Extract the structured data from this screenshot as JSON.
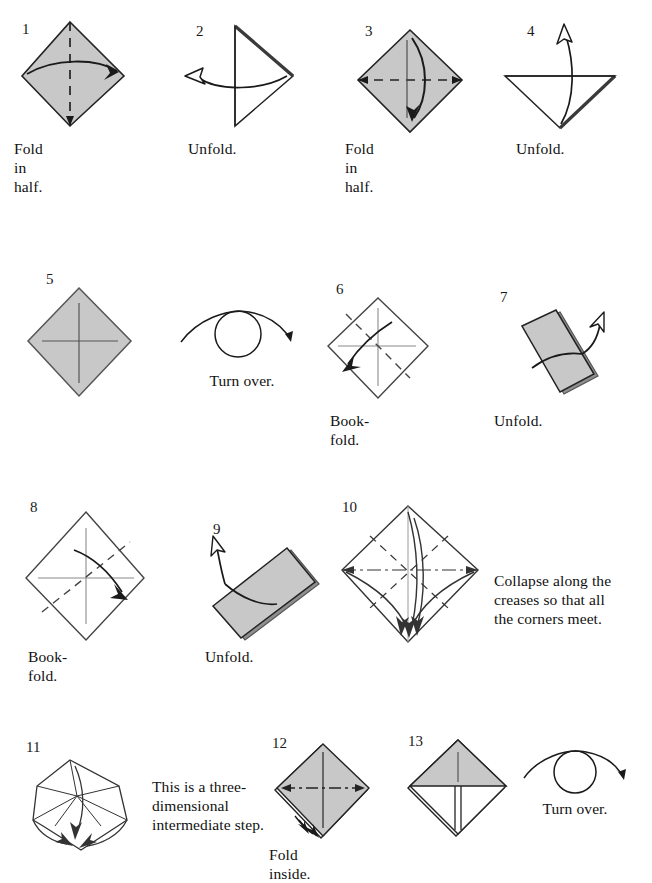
{
  "document": {
    "title": "Origami folding instructions",
    "page_background": "#ffffff",
    "ink_color": "#1a1a1a",
    "paper_gray": "#c8c8c8",
    "paper_gray_edge": "#9a9a9a"
  },
  "steps": [
    {
      "number": "1",
      "caption": "Fold in half.",
      "figure": "shaded-diamond-vertical-dashed-crease",
      "arrow": "solid-arrow-right-curved"
    },
    {
      "number": "2",
      "caption": "Unfold.",
      "figure": "white-triangle-pointing-right",
      "arrow": "hollow-arrow-left-curved"
    },
    {
      "number": "3",
      "caption": "Fold in half.",
      "figure": "shaded-diamond-horizontal-dashed-crease",
      "arrow": "solid-arrow-down-curved"
    },
    {
      "number": "4",
      "caption": "Unfold.",
      "figure": "white-triangle-pointing-down",
      "arrow": "hollow-arrow-up-curved"
    },
    {
      "number": "5",
      "caption": "",
      "figure": "shaded-diamond-with-cross-creases",
      "arrow": "none"
    },
    {
      "number": "6",
      "caption": "Book-fold.",
      "figure": "white-diamond-diagonal-dashed-crease",
      "arrow": "solid-arrow-down-left-curved"
    },
    {
      "number": "7",
      "caption": "Unfold.",
      "figure": "tilted-shaded-rectangle",
      "arrow": "hollow-arrow-up-right-curved"
    },
    {
      "number": "8",
      "caption": "Book-fold.",
      "figure": "white-diamond-diagonal-dashed-crease-alt",
      "arrow": "solid-arrow-down-right-curved"
    },
    {
      "number": "9",
      "caption": "Unfold.",
      "figure": "tilted-shaded-rectangle-alt",
      "arrow": "hollow-arrow-up-left-curved"
    },
    {
      "number": "10",
      "caption": "Collapse along the\ncreases so that all\nthe corners meet.",
      "figure": "white-diamond-full-crease-pattern",
      "arrow": "multiple-collapse-arrows"
    },
    {
      "number": "11",
      "caption": "This is a three-\ndimensional\nintermediate step.",
      "figure": "three-dimensional-intermediate-shape",
      "arrow": "collapse-arrows-down"
    },
    {
      "number": "12",
      "caption": "Fold inside.",
      "figure": "shaded-layered-diamond-dashdot-crease",
      "arrow": "small-fold-inside-arrows"
    },
    {
      "number": "13",
      "caption": "",
      "figure": "shaded-diamond-with-center-flap",
      "arrow": "none"
    }
  ],
  "symbols": [
    {
      "name": "turn-over-symbol-top",
      "label": "Turn over."
    },
    {
      "name": "turn-over-symbol-bottom",
      "label": "Turn over."
    }
  ]
}
